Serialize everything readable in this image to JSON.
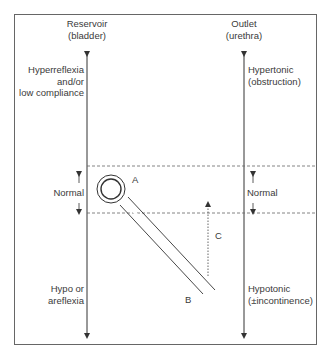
{
  "diagram": {
    "left_axis": {
      "title_line1": "Reservoir",
      "title_line2": "(bladder)",
      "top_label_line1": "Hyperreflexia",
      "top_label_line2": "and/or",
      "top_label_line3": "low compliance",
      "middle_label": "Normal",
      "bottom_label_line1": "Hypo or",
      "bottom_label_line2": "areflexia"
    },
    "right_axis": {
      "title_line1": "Outlet",
      "title_line2": "(urethra)",
      "top_label_line1": "Hypertonic",
      "top_label_line2": "(obstruction)",
      "middle_label": "Normal",
      "bottom_label_line1": "Hypotonic",
      "bottom_label_line2": "(±incontinence)"
    },
    "markers": {
      "a": "A",
      "b": "B",
      "c": "C"
    },
    "colors": {
      "line": "#3a3a3a",
      "frame": "#555555",
      "dashed": "#666666"
    }
  }
}
